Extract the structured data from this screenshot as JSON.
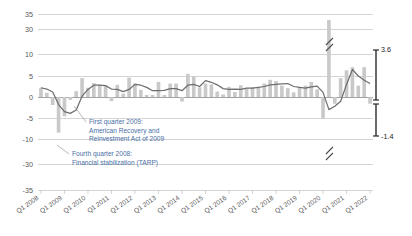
{
  "chart_data": {
    "type": "bar",
    "title": "",
    "xlabel": "",
    "ylabel": "",
    "grid": true,
    "legend_position": "none",
    "axis_break": {
      "upper": {
        "from": 10,
        "to": 30
      },
      "lower": {
        "from": -10,
        "to": -30
      },
      "marker": "double-slash"
    },
    "ylim": [
      -35,
      35
    ],
    "yticks": [
      "35",
      "30",
      "10",
      "5",
      "0",
      "-5",
      "-10",
      "-30",
      "-35"
    ],
    "ytick_values": [
      35,
      30,
      10,
      5,
      0,
      -5,
      -10,
      -30,
      -35
    ],
    "xticks": [
      "Q1 2008",
      "Q1 2009",
      "Q1 2010",
      "Q1 2011",
      "Q1 2012",
      "Q1 2013",
      "Q1 2014",
      "Q1 2015",
      "Q1 2016",
      "Q1 2017",
      "Q1 2018",
      "Q1 2019",
      "Q1 2020",
      "Q1 2021",
      "Q1 2022"
    ],
    "categories": [
      "Q1 2008",
      "Q2 2008",
      "Q3 2008",
      "Q4 2008",
      "Q1 2009",
      "Q2 2009",
      "Q3 2009",
      "Q4 2009",
      "Q1 2010",
      "Q2 2010",
      "Q3 2010",
      "Q4 2010",
      "Q1 2011",
      "Q2 2011",
      "Q3 2011",
      "Q4 2011",
      "Q1 2012",
      "Q2 2012",
      "Q3 2012",
      "Q4 2012",
      "Q1 2013",
      "Q2 2013",
      "Q3 2013",
      "Q4 2013",
      "Q1 2014",
      "Q2 2014",
      "Q3 2014",
      "Q4 2014",
      "Q1 2015",
      "Q2 2015",
      "Q3 2015",
      "Q4 2015",
      "Q1 2016",
      "Q2 2016",
      "Q3 2016",
      "Q4 2016",
      "Q1 2017",
      "Q2 2017",
      "Q3 2017",
      "Q4 2017",
      "Q1 2018",
      "Q2 2018",
      "Q3 2018",
      "Q4 2018",
      "Q1 2019",
      "Q2 2019",
      "Q3 2019",
      "Q4 2019",
      "Q1 2020",
      "Q2 2020",
      "Q3 2020",
      "Q4 2020",
      "Q1 2021",
      "Q2 2021",
      "Q3 2021",
      "Q4 2021",
      "Q1 2022"
    ],
    "series": [
      {
        "name": "Quarterly change",
        "type": "bar",
        "color": "#c9c9c9",
        "values": [
          2.2,
          1.0,
          -1.9,
          -8.5,
          -4.6,
          -0.7,
          1.4,
          4.5,
          2.2,
          3.3,
          2.9,
          2.6,
          -1.0,
          2.9,
          0.8,
          4.6,
          3.2,
          1.7,
          0.5,
          0.5,
          3.6,
          0.5,
          3.2,
          3.2,
          -1.1,
          5.5,
          5.0,
          2.3,
          3.2,
          3.0,
          1.3,
          0.6,
          2.4,
          1.2,
          2.8,
          2.0,
          2.3,
          2.2,
          3.2,
          4.1,
          3.8,
          2.7,
          2.1,
          1.1,
          2.2,
          2.7,
          3.6,
          1.8,
          -5.1,
          31.2,
          -1.6,
          4.5,
          6.3,
          7.0,
          2.7,
          7.0,
          -1.6
        ]
      },
      {
        "name": "Four-quarter moving average",
        "type": "line",
        "color": "#6d6e71",
        "values": [
          2.2,
          1.9,
          1.2,
          -1.8,
          -3.5,
          -3.9,
          -3.1,
          0.2,
          1.8,
          2.8,
          2.8,
          2.7,
          1.9,
          1.8,
          1.3,
          1.8,
          3.0,
          2.8,
          2.3,
          1.5,
          1.5,
          1.6,
          2.0,
          2.0,
          1.5,
          2.8,
          3.0,
          2.5,
          3.9,
          3.5,
          2.9,
          2.0,
          1.8,
          1.9,
          1.8,
          2.1,
          2.1,
          2.3,
          2.5,
          2.9,
          3.0,
          3.1,
          3.2,
          2.5,
          2.3,
          2.1,
          2.4,
          2.6,
          1.1,
          -3.0,
          -2.2,
          -1.0,
          3.0,
          6.5,
          5.0,
          4.0,
          3.2
        ]
      }
    ],
    "annotations": [
      {
        "id": "arra",
        "lines": [
          "First quarter 2009:",
          "American Recovery and",
          "Reinvestment Act of 2009"
        ],
        "target_category": "Q1 2009"
      },
      {
        "id": "tarp",
        "lines": [
          "Fourth quarter 2008:",
          "Financial stabilization (TARP)"
        ],
        "target_category": "Q4 2008"
      }
    ],
    "end_markers": {
      "bracket_label": "range-bracket",
      "upper_value": "3.6",
      "lower_value": "-1.4"
    }
  },
  "colors": {
    "bar": "#c9c9c9",
    "line": "#6d6e71",
    "grid": "#b7b7b7",
    "zero_line": "#8a8a8a",
    "annotation_text": "#4a6fa5",
    "tick_text": "#58585a",
    "end_label": "#1a1a1a",
    "background": "#ffffff"
  }
}
